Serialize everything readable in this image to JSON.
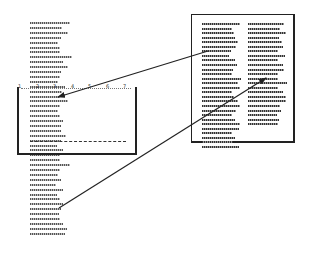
{
  "diagram": {
    "colors": {
      "stroke": "#222222",
      "text_lines": "#666666",
      "background": "#ffffff"
    },
    "source_column": {
      "x": 30,
      "y_start": 22,
      "line_height": 4.9,
      "line_widths": [
        40,
        32,
        38,
        31,
        28,
        30,
        30,
        42,
        33,
        38,
        31,
        30,
        28,
        35,
        32,
        30,
        38,
        30,
        28,
        30,
        33,
        31,
        31,
        36,
        31,
        27,
        33,
        30,
        30,
        40,
        30,
        28,
        31,
        26,
        33,
        27,
        30,
        33,
        31,
        29,
        30,
        33,
        37,
        35,
        33,
        37,
        28,
        35,
        33,
        30,
        30,
        27,
        34,
        37,
        33,
        30,
        32,
        30,
        32,
        31,
        30,
        31,
        29,
        31,
        28,
        30,
        32,
        31,
        30,
        32,
        31,
        28,
        31,
        30,
        31,
        30,
        31
      ]
    },
    "zoom_box": {
      "left": 17,
      "top": 87,
      "right": 137,
      "bottom": 155,
      "ruler_numbers": [
        "1",
        "2",
        "3",
        "4",
        "5",
        "6",
        "7"
      ],
      "ruler_x": [
        18,
        36,
        53,
        71,
        88,
        106,
        123
      ]
    },
    "page_box": {
      "left": 191,
      "top": 14,
      "right": 295,
      "bottom": 143,
      "col1": {
        "x": 202,
        "widths": [
          38,
          30,
          32,
          33,
          36,
          34,
          29,
          27,
          33,
          35,
          31,
          30,
          39,
          36,
          38,
          30,
          32,
          36,
          38,
          34,
          30,
          33,
          38,
          37,
          30,
          33,
          31,
          37
        ]
      },
      "col2": {
        "x": 248,
        "widths": [
          36,
          32,
          38,
          31,
          34,
          35,
          30,
          37,
          30,
          35,
          36,
          30,
          30,
          39,
          30,
          35,
          38,
          38,
          32,
          33,
          29,
          31,
          30
        ]
      },
      "line_start_y": 23,
      "line_height": 4.55
    },
    "arrows": [
      {
        "from": [
          208,
          51
        ],
        "to": [
          58,
          97
        ],
        "arrowhead": "to"
      },
      {
        "from": [
          59,
          208
        ],
        "to": [
          266,
          78
        ],
        "arrowhead": "to"
      }
    ]
  }
}
